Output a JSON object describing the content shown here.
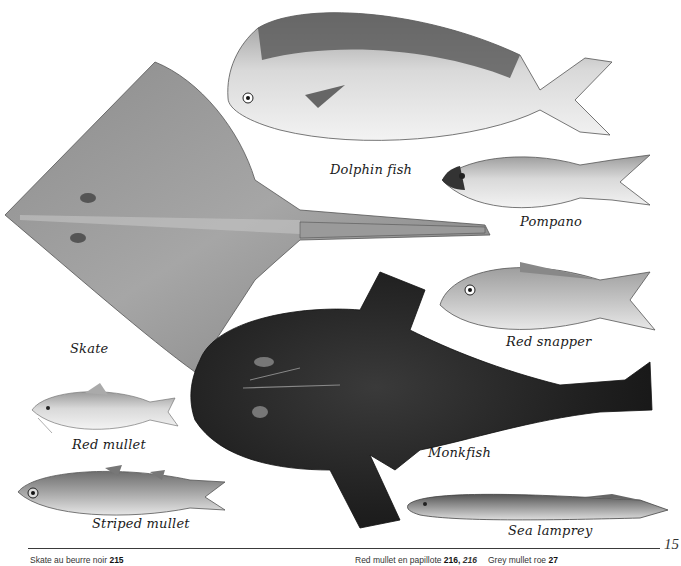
{
  "page": {
    "number": "15",
    "type": "illustrated cookbook page - fish identification plate"
  },
  "fish": [
    {
      "id": "dolphin-fish",
      "caption": "Dolphin fish"
    },
    {
      "id": "pompano",
      "caption": "Pompano"
    },
    {
      "id": "skate",
      "caption": "Skate"
    },
    {
      "id": "red-snapper",
      "caption": "Red snapper"
    },
    {
      "id": "red-mullet",
      "caption": "Red mullet"
    },
    {
      "id": "monkfish",
      "caption": "Monkfish"
    },
    {
      "id": "striped-mullet",
      "caption": "Striped mullet"
    },
    {
      "id": "sea-lamprey",
      "caption": "Sea lamprey"
    }
  ],
  "footer": {
    "refs": [
      {
        "text": "Skate au beurre noir",
        "page": "215",
        "page_italic": ""
      },
      {
        "text": "Red mullet en papillote",
        "page": "216,",
        "page_italic": "216"
      },
      {
        "text": "Grey mullet roe",
        "page": "27",
        "page_italic": ""
      }
    ]
  },
  "colors": {
    "background": "#ffffff",
    "ink": "#1a1a1a",
    "rule": "#3a3a3a"
  }
}
